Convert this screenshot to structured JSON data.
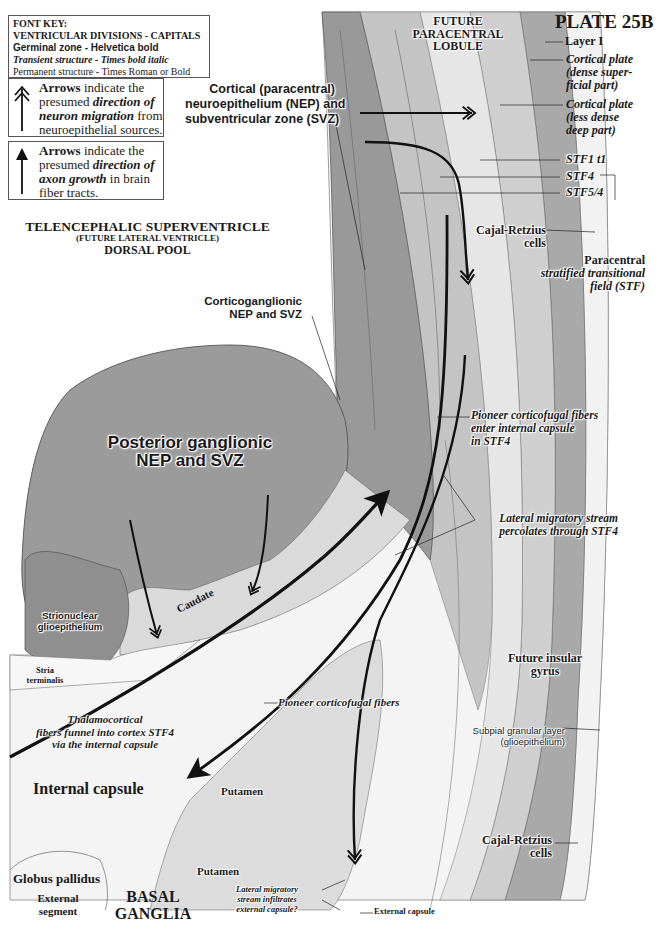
{
  "plate": {
    "title": "PLATE 25B"
  },
  "font_key": {
    "heading": "FONT KEY:",
    "lines": [
      "VENTRICULAR DIVISIONS - CAPITALS",
      "Germinal zone - Helvetica bold",
      "Transient structure - Times bold italic",
      "Permanent structure - Times Roman or Bold"
    ]
  },
  "legend": {
    "migration": {
      "icon": "double-chevron-arrow-up",
      "line1_bold": "Arrows",
      "line1_rest": " indicate the",
      "line2_plain": "presumed ",
      "line2_bi": "direction of",
      "line3_bi": "neuron migration",
      "line3_rest": " from",
      "line4": "neuroepithelial sources."
    },
    "axon": {
      "icon": "solid-arrow-up",
      "line1_bold": "Arrows",
      "line1_rest": " indicate the",
      "line2_plain": "presumed ",
      "line2_bi": "direction of",
      "line3_bi": "axon growth",
      "line3_rest": " in brain",
      "line4": "fiber tracts."
    }
  },
  "ventricle": {
    "line1": "TELENCEPHALIC SUPERVENTRICLE",
    "line2": "(FUTURE LATERAL VENTRICLE)",
    "line3": "DORSAL POOL"
  },
  "labels": {
    "future_paracentral": [
      "FUTURE",
      "PARACENTRAL",
      "LOBULE"
    ],
    "cortical_nep": [
      "Cortical (paracentral)",
      "neuroepithelium (NEP) and",
      "subventricular zone (SVZ)"
    ],
    "layer1": "Layer I",
    "cp_dense": [
      "Cortical plate",
      "(dense super-",
      "ficial part)"
    ],
    "cp_less": [
      "Cortical plate",
      "(less dense",
      "deep part)"
    ],
    "stf1": "STF1 t1",
    "stf4": "STF4",
    "stf54": "STF5/4",
    "cajal_top": [
      "Cajal-Retzius",
      "cells"
    ],
    "paracentral_stf": [
      "Paracentral",
      "stratified transitional",
      "field (STF)"
    ],
    "corticoganglionic": [
      "Corticoganglionic",
      "NEP and SVZ"
    ],
    "posterior_ganglionic": [
      "Posterior ganglionic",
      "NEP and SVZ"
    ],
    "pioneer_enter": [
      "Pioneer corticofugal fibers",
      "enter internal capsule",
      "in STF4"
    ],
    "lateral_percolates": [
      "Lateral migratory stream",
      "percolates through STF4"
    ],
    "strionuclear": [
      "Strionuclear",
      "glioepithelium"
    ],
    "caudate": "Caudate",
    "stria": [
      "Stria",
      "terminalis"
    ],
    "thalamocortical": [
      "Thalamocortical",
      "fibers funnel into cortex STF4",
      "via the internal capsule"
    ],
    "pioneer_fibers": "Pioneer corticofugal fibers",
    "future_insular": [
      "Future insular",
      "gyrus"
    ],
    "subpial": [
      "Subpial granular layer",
      "(glioepithelium)"
    ],
    "internal_capsule": "Internal capsule",
    "putamen_upper": "Putamen",
    "putamen_lower": "Putamen",
    "globus": "Globus pallidus",
    "external_segment": [
      "External",
      "segment"
    ],
    "basal_ganglia": [
      "BASAL",
      "GANGLIA"
    ],
    "lateral_infiltrates": [
      "Lateral migratory",
      "stream infiltrates",
      "external capsule?"
    ],
    "external_capsule": "External capsule",
    "cajal_bottom": [
      "Cajal-Retzius",
      "cells"
    ]
  },
  "colors": {
    "nep_dark": "#8e8e8e",
    "ganglionic": "#9a9a9a",
    "cortex_mid": "#bdbdbd",
    "cortex_light": "#d9d9d9",
    "stf_light": "#ececec",
    "cp_dark": "#a8a8a8",
    "layer1": "#f2f2f2",
    "white_matter": "#f7f7f7",
    "ink": "#111111"
  }
}
